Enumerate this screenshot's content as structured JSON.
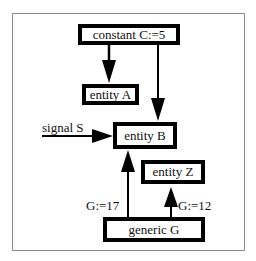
{
  "diagram": {
    "nodes": {
      "constant": {
        "label": "constant C:=5"
      },
      "entity_a": {
        "label": "entity A"
      },
      "entity_b": {
        "label": "entity B"
      },
      "entity_z": {
        "label": "entity Z"
      },
      "generic": {
        "label": "generic G"
      }
    },
    "edge_labels": {
      "signal": "signal S",
      "g17": "G:=17",
      "g12": "G:=12"
    },
    "edges": [
      {
        "from": "constant C:=5",
        "to": "entity A"
      },
      {
        "from": "constant C:=5",
        "to": "entity B"
      },
      {
        "from": "signal S",
        "to": "entity B"
      },
      {
        "from": "generic G",
        "to": "entity B",
        "label": "G:=17"
      },
      {
        "from": "generic G",
        "to": "entity Z",
        "label": "G:=12"
      }
    ]
  }
}
